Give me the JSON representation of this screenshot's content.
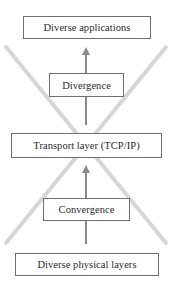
{
  "diagram": {
    "type": "hourglass-layer-diagram",
    "boxes": [
      {
        "id": "apps",
        "label": "Diverse applications"
      },
      {
        "id": "diverge",
        "label": "Divergence"
      },
      {
        "id": "transport",
        "label": "Transport layer (TCP/IP)"
      },
      {
        "id": "converge",
        "label": "Convergence"
      },
      {
        "id": "physical",
        "label": "Diverse physical layers"
      }
    ],
    "edges": [
      {
        "from": "physical",
        "to": "converge",
        "style": "line"
      },
      {
        "from": "converge",
        "to": "transport",
        "style": "arrow-up"
      },
      {
        "from": "transport",
        "to": "diverge",
        "style": "line"
      },
      {
        "from": "diverge",
        "to": "apps",
        "style": "arrow-up"
      }
    ],
    "decoration": {
      "shape": "hourglass-x",
      "description": "Two diagonal gray bands crossing at the transport layer"
    },
    "colors": {
      "box_border": "#6e6e6e",
      "text": "#2a2a2a",
      "arrow": "#8a8a8a",
      "diagonal_band": "#d4d4d4",
      "background": "#ffffff"
    }
  }
}
